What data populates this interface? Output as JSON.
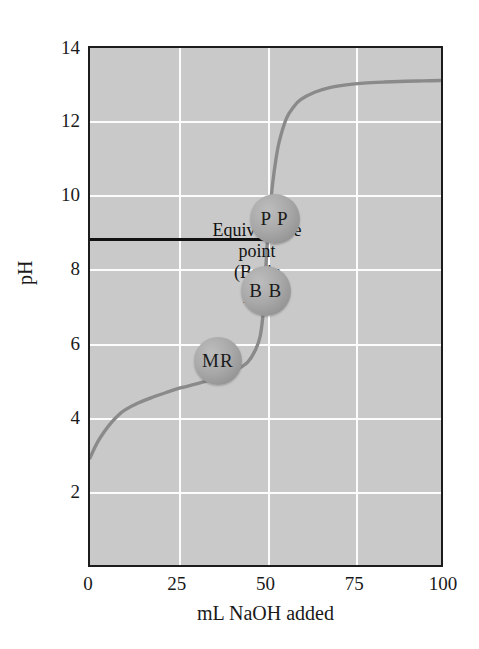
{
  "figure": {
    "background_color": "#ffffff",
    "plot_background_color": "#c9c9c9",
    "gridline_color": "#fcfcfc",
    "frame_color": "#1c1c1c",
    "curve_color": "#8a8a8a",
    "equivalence_line_color": "#111111",
    "bubble_color": "#a9a9a9"
  },
  "chart_data": {
    "type": "line",
    "title": "",
    "xlabel": "mL NaOH added",
    "ylabel": "pH",
    "xlim": [
      0,
      100
    ],
    "ylim": [
      0,
      14
    ],
    "xticks": [
      "0",
      "25",
      "50",
      "75",
      "100"
    ],
    "xtick_values": [
      0,
      25,
      50,
      75,
      100
    ],
    "yticks": [
      "2",
      "4",
      "6",
      "8",
      "10",
      "12",
      "14"
    ],
    "ytick_values": [
      2,
      4,
      6,
      8,
      10,
      12,
      14
    ],
    "grid": true,
    "legend": "none",
    "series": [
      {
        "name": "Titration curve of weak acid with NaOH",
        "color": "#8a8a8a",
        "x": [
          0,
          2,
          4,
          6,
          8,
          10,
          14,
          18,
          22,
          26,
          30,
          34,
          38,
          42,
          45,
          47,
          48.5,
          49.5,
          50,
          50.5,
          51,
          52,
          53,
          54,
          56,
          58,
          60,
          64,
          68,
          73,
          78,
          84,
          90,
          95,
          100
        ],
        "y": [
          2.9,
          3.3,
          3.6,
          3.85,
          4.05,
          4.2,
          4.4,
          4.55,
          4.68,
          4.8,
          4.9,
          5.0,
          5.12,
          5.3,
          5.5,
          5.8,
          6.2,
          7.0,
          7.9,
          8.7,
          9.3,
          10.3,
          11.0,
          11.5,
          12.1,
          12.4,
          12.6,
          12.8,
          12.92,
          13.0,
          13.05,
          13.08,
          13.1,
          13.11,
          13.12
        ]
      }
    ],
    "annotations": [
      {
        "name": "equivalence-point",
        "lines": [
          "Equivalence",
          "point",
          "(Basic",
          "pH)"
        ],
        "marker": "horizontal-line",
        "y_value": 8.9,
        "x_start": 0,
        "x_end": 50
      }
    ],
    "markers": [
      {
        "name": "methyl-red-indicator",
        "label": "MR",
        "x": 36,
        "y": 5.05,
        "radius_px": 24
      },
      {
        "name": "bromthymol-blue-indicator",
        "label": "B B",
        "x": 49.5,
        "y": 6.95,
        "radius_px": 25
      },
      {
        "name": "phenolphthalein-indicator",
        "label": "P P",
        "x": 52,
        "y": 8.9,
        "radius_px": 25
      }
    ]
  }
}
